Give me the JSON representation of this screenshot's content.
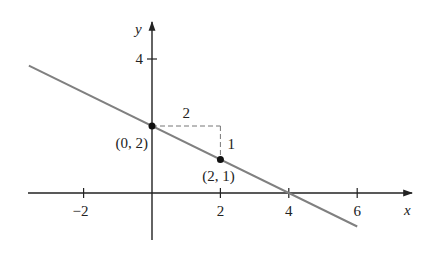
{
  "chart_data": {
    "type": "line",
    "title": "",
    "xlabel": "x",
    "ylabel": "y",
    "xlim": [
      -3.6,
      7.2
    ],
    "ylim": [
      -1.45,
      5.0
    ],
    "x_ticks": [
      {
        "value": -2,
        "label": "−2"
      },
      {
        "value": 2,
        "label": "2"
      },
      {
        "value": 4,
        "label": "4"
      },
      {
        "value": 6,
        "label": "6"
      }
    ],
    "y_ticks": [
      {
        "value": 4,
        "label": "4"
      }
    ],
    "grid": false,
    "series": [
      {
        "name": "line",
        "x": [
          -3.6,
          6
        ],
        "y": [
          3.8,
          -1.0
        ],
        "equation": "y = -x/2 + 2",
        "color": "#808080"
      }
    ],
    "points": [
      {
        "x": 0,
        "y": 2,
        "label": "(0, 2)"
      },
      {
        "x": 2,
        "y": 1,
        "label": "(2, 1)"
      }
    ],
    "slope_triangle": {
      "run": {
        "from": [
          0,
          2
        ],
        "to": [
          2,
          2
        ],
        "label": "2"
      },
      "rise": {
        "from": [
          2,
          2
        ],
        "to": [
          2,
          1
        ],
        "label": "1"
      }
    }
  }
}
